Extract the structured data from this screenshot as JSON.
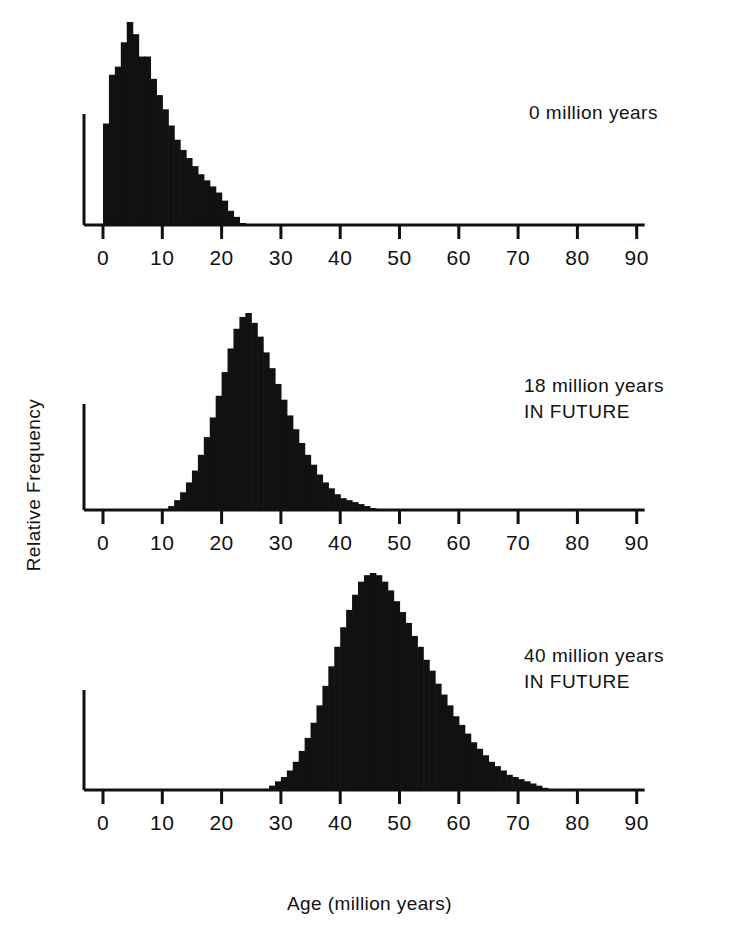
{
  "figure": {
    "xlabel": "Age (million years)",
    "ylabel": "Relative  Frequency",
    "ink_color": "#111111"
  },
  "panels": [
    {
      "annotation": "0 million years",
      "annotation_line1": "0 million years",
      "annotation_line2": ""
    },
    {
      "annotation": "18 million years\nIN FUTURE",
      "annotation_line1": "18 million years",
      "annotation_line2": "IN FUTURE"
    },
    {
      "annotation": "40 million years\nIN FUTURE",
      "annotation_line1": "40 million years",
      "annotation_line2": "IN FUTURE"
    }
  ],
  "axis": {
    "tick_labels": [
      "0",
      "10",
      "20",
      "30",
      "40",
      "50",
      "60",
      "70",
      "80",
      "90"
    ],
    "tick_values": [
      0,
      10,
      20,
      30,
      40,
      50,
      60,
      70,
      80,
      90
    ],
    "xmin": 0,
    "xmax": 90
  },
  "chart_data": {
    "type": "bar",
    "title": "",
    "subtitle": "",
    "xlabel": "Age (million years)",
    "ylabel": "Relative  Frequency",
    "xlim": [
      0,
      90
    ],
    "ylim": [
      0,
      1
    ],
    "grid": false,
    "legend": null,
    "bin_width": 1,
    "panels": [
      {
        "name": "0 million years",
        "annotation": "0 million years",
        "x": [
          0,
          1,
          2,
          3,
          4,
          5,
          6,
          7,
          8,
          9,
          10,
          11,
          12,
          13,
          14,
          15,
          16,
          17,
          18,
          19,
          20,
          21,
          22,
          23
        ],
        "values": [
          0.5,
          0.74,
          0.78,
          0.9,
          1.0,
          0.94,
          0.83,
          0.83,
          0.72,
          0.64,
          0.57,
          0.49,
          0.42,
          0.37,
          0.33,
          0.29,
          0.25,
          0.22,
          0.19,
          0.16,
          0.12,
          0.07,
          0.04,
          0.01
        ],
        "peak_age": 4,
        "range": [
          0,
          23
        ]
      },
      {
        "name": "18 million years IN FUTURE",
        "annotation": "18 million years IN FUTURE",
        "x": [
          11,
          12,
          13,
          14,
          15,
          16,
          17,
          18,
          19,
          20,
          21,
          22,
          23,
          24,
          25,
          26,
          27,
          28,
          29,
          30,
          31,
          32,
          33,
          34,
          35,
          36,
          37,
          38,
          39,
          40,
          41,
          42,
          43,
          44,
          45
        ],
        "values": [
          0.02,
          0.05,
          0.09,
          0.14,
          0.2,
          0.28,
          0.37,
          0.47,
          0.58,
          0.7,
          0.82,
          0.92,
          0.98,
          1.0,
          0.95,
          0.88,
          0.8,
          0.72,
          0.64,
          0.56,
          0.48,
          0.41,
          0.34,
          0.28,
          0.23,
          0.18,
          0.14,
          0.11,
          0.08,
          0.06,
          0.05,
          0.04,
          0.03,
          0.02,
          0.01
        ],
        "peak_age": 24,
        "range": [
          11,
          45
        ]
      },
      {
        "name": "40 million years IN FUTURE",
        "annotation": "40 million years IN FUTURE",
        "x": [
          28,
          29,
          30,
          31,
          32,
          33,
          34,
          35,
          36,
          37,
          38,
          39,
          40,
          41,
          42,
          43,
          44,
          45,
          46,
          47,
          48,
          49,
          50,
          51,
          52,
          53,
          54,
          55,
          56,
          57,
          58,
          59,
          60,
          61,
          62,
          63,
          64,
          65,
          66,
          67,
          68,
          69,
          70,
          71,
          72,
          73,
          74
        ],
        "values": [
          0.02,
          0.04,
          0.06,
          0.09,
          0.13,
          0.18,
          0.24,
          0.31,
          0.39,
          0.48,
          0.57,
          0.66,
          0.75,
          0.83,
          0.9,
          0.96,
          0.99,
          1.0,
          0.99,
          0.96,
          0.92,
          0.87,
          0.82,
          0.77,
          0.71,
          0.66,
          0.6,
          0.55,
          0.49,
          0.44,
          0.39,
          0.34,
          0.3,
          0.26,
          0.22,
          0.19,
          0.16,
          0.13,
          0.11,
          0.09,
          0.07,
          0.06,
          0.05,
          0.04,
          0.03,
          0.02,
          0.01
        ],
        "peak_age": 45,
        "range": [
          28,
          74
        ]
      }
    ]
  }
}
